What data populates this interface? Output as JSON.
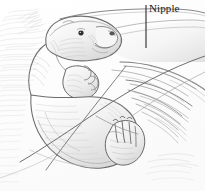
{
  "figure": {
    "title": "Nipple",
    "medium": "pencil sketch illustration",
    "background_color": "#ffffff",
    "ink_color": "#4a4a4a",
    "dark_ink_color": "#1b1b1b",
    "mid_tone_color": "#8d8d8d",
    "light_tone_color": "#c9c9c9",
    "faint_tone_color": "#e2e2e2"
  },
  "annotations": [
    {
      "id": "nipple",
      "label": "Nipple",
      "text_x": 149,
      "text_y": 2,
      "leader_x": 146,
      "leader_y_start": 5,
      "leader_y_end": 48,
      "leader_color": "#2a2a2a"
    }
  ],
  "canvas": {
    "width": 205,
    "height": 191
  }
}
